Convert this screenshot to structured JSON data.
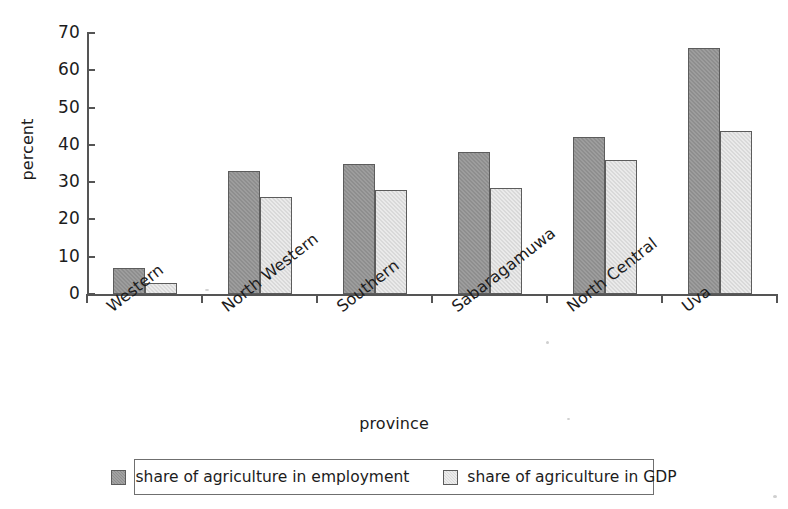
{
  "chart_data": {
    "type": "bar",
    "title": "",
    "xlabel": "province",
    "ylabel": "percent",
    "ylim": [
      0,
      70
    ],
    "yticks": [
      0,
      10,
      20,
      30,
      40,
      50,
      60,
      70
    ],
    "grid": false,
    "legend_position": "bottom",
    "categories": [
      "Western",
      "North Western",
      "Southern",
      "Sabaragamuwa",
      "North Central",
      "Uva"
    ],
    "series": [
      {
        "name": "share of agriculture in employment",
        "color": "#8e8e8e",
        "values": [
          7,
          33,
          35,
          38,
          42,
          66
        ]
      },
      {
        "name": "share of agriculture in GDP",
        "color": "#d9d9d9",
        "values": [
          3,
          26,
          28,
          28.5,
          36,
          43.8
        ]
      }
    ]
  },
  "axes": {
    "y_title": "percent",
    "x_title": "province",
    "y_tick_labels": [
      "0",
      "10",
      "20",
      "30",
      "40",
      "50",
      "60",
      "70"
    ],
    "x_tick_labels": [
      "Western",
      "North Western",
      "Southern",
      "Sabaragamuwa",
      "North Central",
      "Uva"
    ]
  },
  "legend": {
    "entries": [
      {
        "label": "share of agriculture in employment",
        "swatch": "dark-gray-swatch"
      },
      {
        "label": "share of agriculture in GDP",
        "swatch": "light-gray-swatch"
      }
    ]
  }
}
